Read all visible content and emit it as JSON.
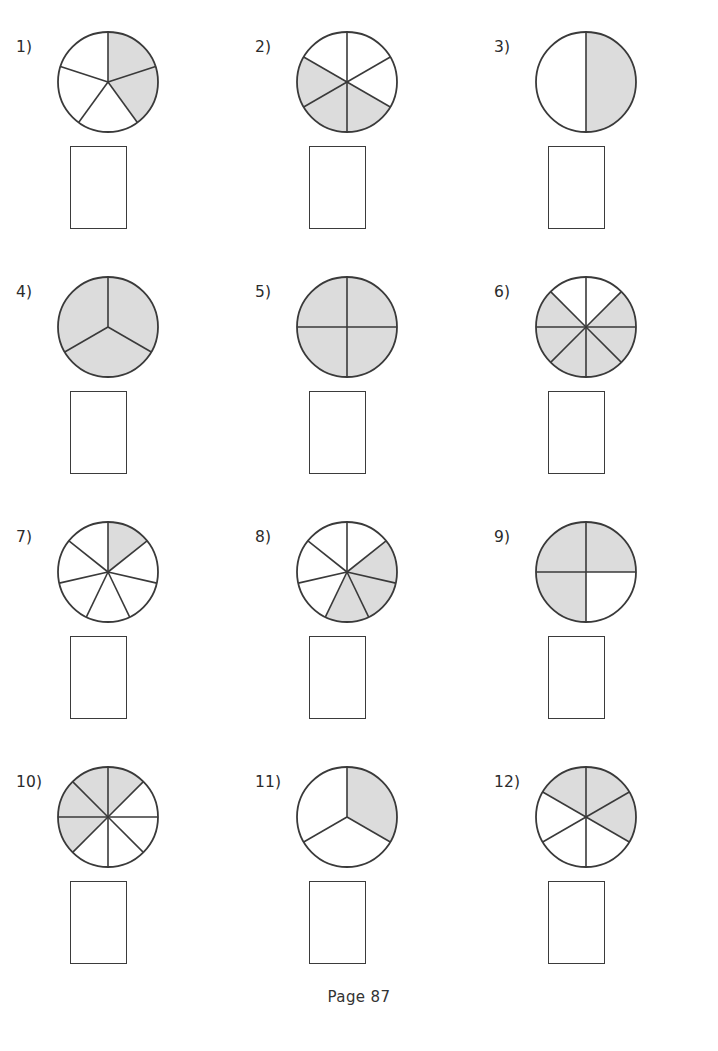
{
  "page": {
    "footer_label": "Page  87",
    "shade_color": "#dcdcdc",
    "stroke_color": "#3a3a3a",
    "background_color": "#ffffff",
    "box_border_color": "#3b3b3b"
  },
  "problems": [
    {
      "label": "1)",
      "total_parts": 5,
      "shaded_parts": 2,
      "fraction": "2/5",
      "shaded_indices": [
        0,
        1
      ],
      "start_angle": 90,
      "direction": "clockwise"
    },
    {
      "label": "2)",
      "total_parts": 6,
      "shaded_parts": 3,
      "fraction": "3/6",
      "shaded_indices": [
        2,
        3,
        4
      ],
      "start_angle": 90,
      "direction": "clockwise"
    },
    {
      "label": "3)",
      "total_parts": 2,
      "shaded_parts": 1,
      "fraction": "1/2",
      "shaded_indices": [
        0
      ],
      "start_angle": 90,
      "direction": "clockwise"
    },
    {
      "label": "4)",
      "total_parts": 3,
      "shaded_parts": 3,
      "fraction": "3/3",
      "shaded_indices": [
        0,
        1,
        2
      ],
      "start_angle": 90,
      "direction": "clockwise"
    },
    {
      "label": "5)",
      "total_parts": 4,
      "shaded_parts": 4,
      "fraction": "4/4",
      "shaded_indices": [
        0,
        1,
        2,
        3
      ],
      "start_angle": 90,
      "direction": "clockwise"
    },
    {
      "label": "6)",
      "total_parts": 8,
      "shaded_parts": 6,
      "fraction": "6/8",
      "shaded_indices": [
        1,
        2,
        3,
        4,
        5,
        6
      ],
      "start_angle": 90,
      "direction": "clockwise"
    },
    {
      "label": "7)",
      "total_parts": 7,
      "shaded_parts": 1,
      "fraction": "1/7",
      "shaded_indices": [
        0
      ],
      "start_angle": 90,
      "direction": "clockwise"
    },
    {
      "label": "8)",
      "total_parts": 7,
      "shaded_parts": 3,
      "fraction": "3/7",
      "shaded_indices": [
        1,
        2,
        3
      ],
      "start_angle": 90,
      "direction": "clockwise"
    },
    {
      "label": "9)",
      "total_parts": 4,
      "shaded_parts": 3,
      "fraction": "3/4",
      "shaded_indices": [
        0,
        2,
        3
      ],
      "start_angle": 90,
      "direction": "clockwise"
    },
    {
      "label": "10)",
      "total_parts": 8,
      "shaded_parts": 4,
      "fraction": "4/8",
      "shaded_indices": [
        0,
        5,
        6,
        7
      ],
      "start_angle": 90,
      "direction": "clockwise"
    },
    {
      "label": "11)",
      "total_parts": 3,
      "shaded_parts": 1,
      "fraction": "1/3",
      "shaded_indices": [
        0
      ],
      "start_angle": 90,
      "direction": "clockwise"
    },
    {
      "label": "12)",
      "total_parts": 6,
      "shaded_parts": 3,
      "fraction": "3/6",
      "shaded_indices": [
        0,
        1,
        5
      ],
      "start_angle": 90,
      "direction": "clockwise"
    }
  ],
  "answer_boxes": [
    {
      "value": ""
    },
    {
      "value": ""
    },
    {
      "value": ""
    },
    {
      "value": ""
    },
    {
      "value": ""
    },
    {
      "value": ""
    },
    {
      "value": ""
    },
    {
      "value": ""
    },
    {
      "value": ""
    },
    {
      "value": ""
    },
    {
      "value": ""
    },
    {
      "value": ""
    }
  ]
}
